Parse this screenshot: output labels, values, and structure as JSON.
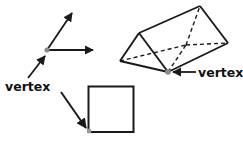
{
  "figure": {
    "background_color": "#ffffff",
    "stroke_color": "#1a1a1a",
    "vertex_dot_color": "#808080",
    "width": 243,
    "height": 142
  },
  "labels": {
    "left_vertex": "vertex",
    "right_vertex": "vertex"
  },
  "shapes": {
    "angle": {
      "name": "angle",
      "vertex_point": [
        47,
        50
      ],
      "ray_diagonal_end": [
        73,
        12
      ],
      "ray_horizontal_end": [
        96,
        50
      ]
    },
    "square": {
      "name": "square",
      "x": 88,
      "y": 86,
      "width": 45,
      "height": 46,
      "marked_corner": [
        89,
        131
      ]
    },
    "prism": {
      "name": "triangular-prism",
      "front_top": [
        139,
        33
      ],
      "front_left": [
        120,
        61
      ],
      "front_bottom": [
        168,
        72
      ],
      "back_top": [
        200,
        6
      ],
      "back_right": [
        228,
        43
      ],
      "hidden_vertex": [
        186,
        45
      ],
      "marked_vertex": [
        168,
        72
      ]
    }
  },
  "pointers": {
    "left_label_to_angle_vertex": {
      "from": [
        28,
        78
      ],
      "to": [
        46,
        55
      ]
    },
    "left_label_to_square_corner": {
      "from": [
        62,
        93
      ],
      "to": [
        88,
        130
      ]
    },
    "right_label_to_prism_vertex": {
      "from": [
        196,
        72
      ],
      "to": [
        171,
        72
      ]
    }
  }
}
